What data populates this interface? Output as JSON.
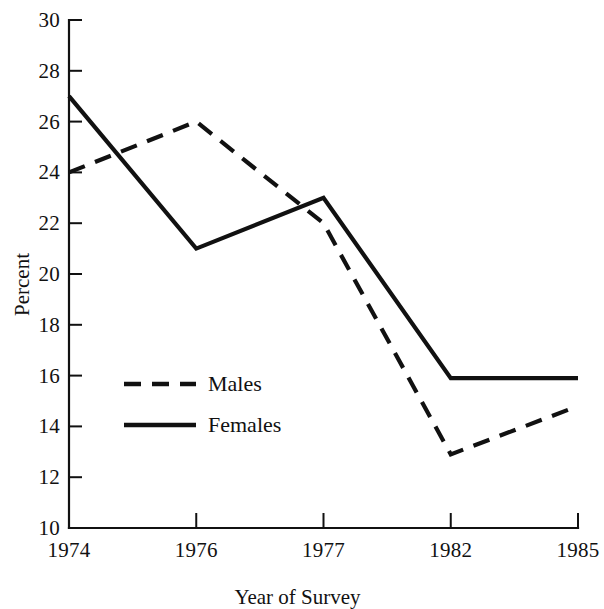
{
  "chart_data": {
    "type": "line",
    "title": "",
    "xlabel": "Year of Survey",
    "ylabel": "Percent",
    "categories": [
      "1974",
      "1976",
      "1977",
      "1982",
      "1985"
    ],
    "ylim": [
      10,
      30
    ],
    "yticks": [
      10,
      12,
      14,
      16,
      18,
      20,
      22,
      24,
      26,
      28,
      30
    ],
    "grid": false,
    "legend_position": "lower-left inside axes",
    "series": [
      {
        "name": "Males",
        "style": "dashed",
        "color": "#111111",
        "values": [
          27,
          21,
          23,
          15.9,
          15.9
        ]
      },
      {
        "name": "Females",
        "style": "solid",
        "color": "#111111",
        "values": [
          24,
          26,
          22,
          12.9,
          14.8
        ]
      }
    ]
  },
  "legend": {
    "entries": [
      {
        "label": "Males"
      },
      {
        "label": "Females"
      }
    ]
  },
  "axes": {
    "y_tick_labels": [
      "30",
      "28",
      "26",
      "24",
      "22",
      "20",
      "18",
      "16",
      "14",
      "12",
      "10"
    ],
    "x_tick_labels": [
      "1974",
      "1976",
      "1977",
      "1982",
      "1985"
    ],
    "y_title": "Percent",
    "x_title": "Year of Survey"
  }
}
